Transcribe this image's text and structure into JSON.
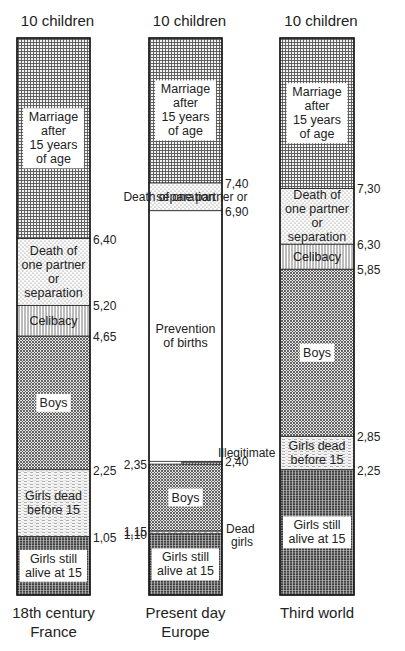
{
  "chart_data": {
    "type": "bar",
    "subtype": "stacked-column",
    "title": "",
    "ylim": [
      0,
      10
    ],
    "top_label": "10 children",
    "legend": "none (labels inside segments)",
    "categories": [
      "18th century\nFrance",
      "Present day\nEurope",
      "Third world"
    ],
    "columns": [
      {
        "name": "18th century France",
        "label_lines": [
          "18th century",
          "France"
        ],
        "top_label": "10 children",
        "segments": [
          {
            "name": "Girls still alive at 15",
            "label_lines": [
              "Girls still",
              "alive at 15"
            ],
            "from": 0,
            "to": 1.05,
            "pattern": "dense-grid"
          },
          {
            "name": "Girls dead before 15",
            "label_lines": [
              "Girls dead",
              "before 15"
            ],
            "from": 1.05,
            "to": 2.25,
            "pattern": "dashes"
          },
          {
            "name": "Boys",
            "label_lines": [
              "Boys"
            ],
            "from": 2.25,
            "to": 4.65,
            "pattern": "crosshatch"
          },
          {
            "name": "Celibacy",
            "label_lines": [
              "Celibacy"
            ],
            "from": 4.65,
            "to": 5.2,
            "pattern": "vertical-lines"
          },
          {
            "name": "Death of one partner or separation",
            "label_lines": [
              "Death of",
              "one partner",
              "or",
              "separation"
            ],
            "from": 5.2,
            "to": 6.4,
            "pattern": "dots"
          },
          {
            "name": "Marriage after 15 years of age",
            "label_lines": [
              "Marriage",
              "after",
              "15 years",
              "of age"
            ],
            "from": 6.4,
            "to": 10,
            "pattern": "grid"
          }
        ],
        "tick_labels": [
          {
            "value": 6.4,
            "text": "6,40",
            "side": "right"
          },
          {
            "value": 5.2,
            "text": "5,20",
            "side": "right"
          },
          {
            "value": 4.65,
            "text": "4,65",
            "side": "right"
          },
          {
            "value": 2.25,
            "text": "2,25",
            "side": "right"
          },
          {
            "value": 1.05,
            "text": "1,05",
            "side": "right"
          }
        ]
      },
      {
        "name": "Present day Europe",
        "label_lines": [
          "Present day",
          "Europe"
        ],
        "top_label": "10 children",
        "segments": [
          {
            "name": "Girls still alive at 15",
            "label_lines": [
              "Girls still",
              "alive at 15"
            ],
            "from": 0,
            "to": 1.1,
            "pattern": "dense-grid"
          },
          {
            "name": "Dead girls",
            "label_lines": [],
            "from": 1.1,
            "to": 1.15,
            "pattern": "dashes"
          },
          {
            "name": "Boys",
            "label_lines": [
              "Boys"
            ],
            "from": 1.15,
            "to": 2.35,
            "pattern": "crosshatch"
          },
          {
            "name": "Illegitimate",
            "label_lines": [],
            "from": 2.35,
            "to": 2.4,
            "pattern": "grid",
            "partial": true
          },
          {
            "name": "Prevention of births",
            "label_lines": [
              "Prevention",
              "of births"
            ],
            "from": 2.4,
            "to": 6.9,
            "pattern": "none"
          },
          {
            "name": "Death of one partner or separation",
            "label_lines": [
              "separation"
            ],
            "from": 6.9,
            "to": 7.4,
            "pattern": "dots"
          },
          {
            "name": "Marriage after 15 years of age",
            "label_lines": [
              "Marriage",
              "after",
              "15 years",
              "of age"
            ],
            "from": 7.4,
            "to": 10,
            "pattern": "grid"
          }
        ],
        "tick_labels": [
          {
            "value": 7.4,
            "text": "7,40",
            "side": "right"
          },
          {
            "value": 6.9,
            "text": "6,90",
            "side": "right"
          },
          {
            "value": 2.4,
            "text": "2,40",
            "side": "right"
          },
          {
            "value": 2.35,
            "text": "2,35",
            "side": "left"
          },
          {
            "value": 1.15,
            "text": "1,15",
            "side": "left"
          },
          {
            "value": 1.1,
            "text": "1,10",
            "side": "left"
          }
        ],
        "annotations": [
          {
            "text": "Death of one partner or",
            "near_value": 7.15
          },
          {
            "text": "Illegitimate",
            "near_value": 2.55
          },
          {
            "text": "Dead",
            "near_value": 1.18
          },
          {
            "text": "girls",
            "near_value": 0.95
          }
        ]
      },
      {
        "name": "Third world",
        "label_lines": [
          "Third world"
        ],
        "top_label": "10 children",
        "segments": [
          {
            "name": "Girls still alive at 15",
            "label_lines": [
              "Girls still",
              "alive at 15"
            ],
            "from": 0,
            "to": 2.25,
            "pattern": "dense-grid"
          },
          {
            "name": "Girls dead before 15",
            "label_lines": [
              "Girls dead",
              "before 15"
            ],
            "from": 2.25,
            "to": 2.85,
            "pattern": "dashes"
          },
          {
            "name": "Boys",
            "label_lines": [
              "Boys"
            ],
            "from": 2.85,
            "to": 5.85,
            "pattern": "crosshatch"
          },
          {
            "name": "Celibacy",
            "label_lines": [
              "Celibacy"
            ],
            "from": 5.85,
            "to": 6.3,
            "pattern": "vertical-lines"
          },
          {
            "name": "Death of one partner or separation",
            "label_lines": [
              "Death of",
              "one partner",
              "or",
              "separation"
            ],
            "from": 6.3,
            "to": 7.3,
            "pattern": "dots"
          },
          {
            "name": "Marriage after 15 years of age",
            "label_lines": [
              "Marriage",
              "after",
              "15 years",
              "of age"
            ],
            "from": 7.3,
            "to": 10,
            "pattern": "grid"
          }
        ],
        "tick_labels": [
          {
            "value": 7.3,
            "text": "7,30",
            "side": "right"
          },
          {
            "value": 6.3,
            "text": "6,30",
            "side": "right"
          },
          {
            "value": 5.85,
            "text": "5,85",
            "side": "right"
          },
          {
            "value": 2.85,
            "text": "2,85",
            "side": "right"
          },
          {
            "value": 2.25,
            "text": "2,25",
            "side": "right"
          }
        ]
      }
    ]
  }
}
